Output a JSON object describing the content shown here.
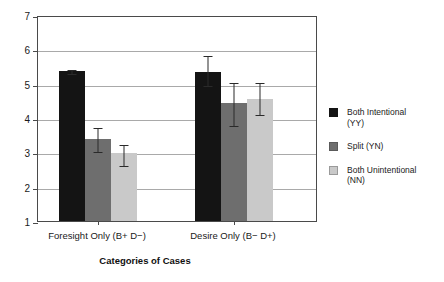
{
  "chart_data": {
    "type": "bar",
    "title": "",
    "xlabel": "Categories of Cases",
    "ylabel": "",
    "ylim": [
      1,
      7
    ],
    "yticks": [
      "1",
      "2",
      "3",
      "4",
      "5",
      "6",
      "7"
    ],
    "grid": true,
    "legend_position": "right",
    "categories": [
      "Foresight Only (B+ D−)",
      "Desire Only (B− D+)"
    ],
    "series": [
      {
        "name": "Both Intentional (YY)",
        "color": "#141414",
        "values": [
          5.38,
          5.33
        ],
        "errors_low": [
          5.3,
          4.97
        ],
        "errors_high": [
          5.46,
          5.86
        ]
      },
      {
        "name": "Split (YN)",
        "color": "#6e6e6e",
        "values": [
          3.4,
          4.45
        ],
        "errors_low": [
          3.03,
          3.79
        ],
        "errors_high": [
          3.77,
          5.08
        ]
      },
      {
        "name": "Both Unintentional (NN)",
        "color": "#c9c9c9",
        "values": [
          2.97,
          4.56
        ],
        "errors_low": [
          2.63,
          4.12
        ],
        "errors_high": [
          3.28,
          5.07
        ]
      }
    ]
  },
  "legend": {
    "items": [
      {
        "line1": "Both Intentional",
        "line2": "(YY)",
        "swatch": "#141414"
      },
      {
        "line1": "Split (YN)",
        "line2": "",
        "swatch": "#6e6e6e"
      },
      {
        "line1": "Both Unintentional",
        "line2": "(NN)",
        "swatch": "#c9c9c9"
      }
    ]
  },
  "axis": {
    "y_tick_1": "1",
    "y_tick_2": "2",
    "y_tick_3": "3",
    "y_tick_4": "4",
    "y_tick_5": "5",
    "y_tick_6": "6",
    "y_tick_7": "7",
    "x_title": "Categories of Cases",
    "cat_1": "Foresight Only (B+ D−)",
    "cat_2": "Desire Only (B− D+)"
  }
}
